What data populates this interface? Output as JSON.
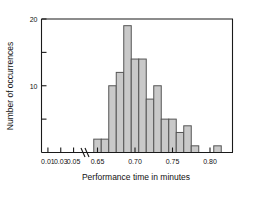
{
  "chart_data": {
    "type": "bar",
    "title": "",
    "subtitle": "",
    "xlabel": "Performance time in minutes",
    "ylabel": "Number of occurrences",
    "grid": false,
    "legend": "none",
    "axis_break": {
      "present": true,
      "after_tick": "0.05",
      "before_tick": "0.65"
    },
    "xlim": [
      0.0,
      0.83
    ],
    "ylim": [
      0,
      20
    ],
    "x_ticks": [
      "0.01",
      "0.03",
      "0.05",
      "0.65",
      "0.70",
      "0.75",
      "0.80"
    ],
    "x_tick_values": [
      0.01,
      0.03,
      0.05,
      0.65,
      0.7,
      0.75,
      0.8
    ],
    "y_ticks": [
      "20",
      "10"
    ],
    "y_tick_values": [
      20,
      15,
      10,
      5
    ],
    "y_tick_labels_shown": [
      20,
      10
    ],
    "bin_width": 0.01,
    "bin_edges": [
      0.645,
      0.655,
      0.665,
      0.675,
      0.685,
      0.695,
      0.705,
      0.715,
      0.725,
      0.735,
      0.745,
      0.755,
      0.765,
      0.775,
      0.785,
      0.805,
      0.815
    ],
    "categories": [
      "0.645-0.655",
      "0.655-0.665",
      "0.665-0.675",
      "0.675-0.685",
      "0.685-0.695",
      "0.695-0.705",
      "0.705-0.715",
      "0.715-0.725",
      "0.725-0.735",
      "0.735-0.745",
      "0.745-0.755",
      "0.755-0.765",
      "0.765-0.775",
      "0.775-0.785",
      "0.805-0.815"
    ],
    "bars": [
      {
        "x0": 0.645,
        "x1": 0.655,
        "value": 2
      },
      {
        "x0": 0.655,
        "x1": 0.665,
        "value": 2
      },
      {
        "x0": 0.665,
        "x1": 0.675,
        "value": 10
      },
      {
        "x0": 0.675,
        "x1": 0.685,
        "value": 12
      },
      {
        "x0": 0.685,
        "x1": 0.695,
        "value": 19
      },
      {
        "x0": 0.695,
        "x1": 0.705,
        "value": 14
      },
      {
        "x0": 0.705,
        "x1": 0.715,
        "value": 14
      },
      {
        "x0": 0.715,
        "x1": 0.725,
        "value": 8
      },
      {
        "x0": 0.725,
        "x1": 0.735,
        "value": 10
      },
      {
        "x0": 0.735,
        "x1": 0.745,
        "value": 5
      },
      {
        "x0": 0.745,
        "x1": 0.755,
        "value": 5
      },
      {
        "x0": 0.755,
        "x1": 0.765,
        "value": 3
      },
      {
        "x0": 0.765,
        "x1": 0.775,
        "value": 4
      },
      {
        "x0": 0.775,
        "x1": 0.785,
        "value": 1
      },
      {
        "x0": 0.805,
        "x1": 0.815,
        "value": 1
      }
    ],
    "values": [
      2,
      2,
      10,
      12,
      19,
      14,
      14,
      8,
      10,
      5,
      5,
      3,
      4,
      1,
      1
    ],
    "colors": {
      "bar_fill": "#c9c9c9",
      "bar_edge": "#555555",
      "axis": "#1a1a1a",
      "background": "#ffffff"
    }
  }
}
